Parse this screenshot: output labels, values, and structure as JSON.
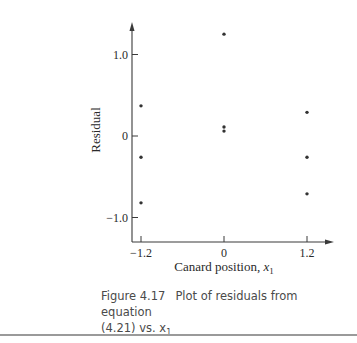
{
  "chart_data": {
    "type": "scatter",
    "title": "",
    "xlabel": "Canard position, x",
    "xlabel_subscript": "1",
    "ylabel": "Residual",
    "x_ticks": [
      -1.2,
      0,
      1.2
    ],
    "x_tick_labels": [
      "−1.2",
      "0",
      "1.2"
    ],
    "y_ticks": [
      -1.0,
      0,
      1.0
    ],
    "y_tick_labels": [
      "−1.0",
      "0",
      "1.0"
    ],
    "xlim": [
      -1.3,
      1.5
    ],
    "ylim": [
      -1.3,
      1.4
    ],
    "grid": false,
    "legend": null,
    "points": [
      {
        "x": -1.2,
        "y": 0.37
      },
      {
        "x": -1.2,
        "y": -0.26
      },
      {
        "x": -1.2,
        "y": -0.82
      },
      {
        "x": 0,
        "y": 1.25
      },
      {
        "x": 0,
        "y": 0.11
      },
      {
        "x": 0,
        "y": 0.06
      },
      {
        "x": 1.2,
        "y": 0.29
      },
      {
        "x": 1.2,
        "y": -0.26
      },
      {
        "x": 1.2,
        "y": -0.71
      }
    ]
  },
  "caption": {
    "figure_number": "Figure 4.17",
    "text_line1": "Plot of residuals from equation",
    "text_line2": "(4.21) vs. x",
    "text_subscript": "1"
  }
}
